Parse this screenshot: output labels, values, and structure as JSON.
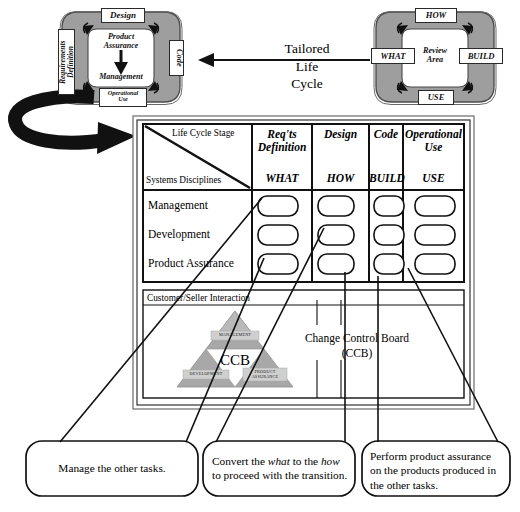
{
  "headline": {
    "line1": "Tailored",
    "line2": "Life",
    "line3": "Cycle"
  },
  "left_wheel": {
    "name": "tailored-life-cycle-wheel",
    "top_label": "Design",
    "left_label": "Requirements\nDefinition",
    "right_label": "Code",
    "bottom_label": "Operational\nUse",
    "hub_top": "Product\nAssurance",
    "hub_bottom": "Management"
  },
  "right_wheel": {
    "name": "review-area-wheel",
    "top_label": "HOW",
    "left_label": "WHAT",
    "right_label": "BUILD",
    "bottom_label": "USE",
    "hub": "Review\nArea"
  },
  "matrix": {
    "corner_top_right": "Life Cycle Stage",
    "corner_bottom_left": "Systems Disciplines",
    "columns": [
      {
        "stage": "Req'ts\nDefinition",
        "key": "WHAT"
      },
      {
        "stage": "Design",
        "key": "HOW"
      },
      {
        "stage": "Code",
        "key": "BUILD"
      },
      {
        "stage": "Operational\nUse",
        "key": "USE"
      }
    ],
    "rows": [
      "Management",
      "Development",
      "Product Assurance"
    ],
    "cell_shape": "rounded-rectangle-task"
  },
  "interaction_band": {
    "label": "Customer/Seller Interaction",
    "triangle": {
      "center_label": "CCB",
      "top_label": "MANAGEMENT",
      "bottom_left_label": "DEVELOPMENT",
      "bottom_right_label": "PRODUCT\nASSURANCE"
    }
  },
  "ccb_note": {
    "line1": "Change Control Board",
    "line2": "(CCB)"
  },
  "callouts": [
    {
      "name": "callout-management",
      "text": "Manage the other tasks."
    },
    {
      "name": "callout-development",
      "segments": [
        {
          "text": "Convert the ",
          "italic": false
        },
        {
          "text": "what",
          "italic": true
        },
        {
          "text": " to the ",
          "italic": false
        },
        {
          "text": "how",
          "italic": true
        },
        {
          "text": "\nto proceed with the transition.",
          "italic": false
        }
      ]
    },
    {
      "name": "callout-product-assurance",
      "text": "Perform product assurance\non the products produced in\nthe other tasks."
    }
  ],
  "colors": {
    "wheel_ring": "#9e9e9e",
    "wheel_ring_edge": "#4d4d4d",
    "hub_fill": "#ffffff",
    "triangle_fill": "#a8a8a8",
    "triangle_inner": "#c8c8c8",
    "band_fill": "#efefef",
    "line": "#111111",
    "page_bg": "#ffffff"
  }
}
